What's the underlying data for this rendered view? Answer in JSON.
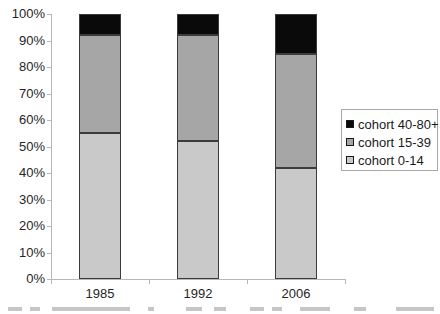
{
  "chart_data": {
    "type": "bar",
    "subtype": "stacked-100-percent-column",
    "title": "",
    "xlabel": "",
    "ylabel": "",
    "categories": [
      "1985",
      "1992",
      "2006"
    ],
    "series": [
      {
        "name": "cohort 0-14",
        "color": "#c9c9c9",
        "values": [
          55,
          52,
          42
        ]
      },
      {
        "name": "cohort 15-39",
        "color": "#a6a6a6",
        "values": [
          37,
          40,
          43
        ]
      },
      {
        "name": "cohort 40-80+",
        "color": "#0a0a0a",
        "values": [
          8,
          8,
          15
        ]
      }
    ],
    "y_tick_labels": [
      "100%",
      "90%",
      "80%",
      "70%",
      "60%",
      "50%",
      "40%",
      "30%",
      "20%",
      "10%",
      "0%"
    ],
    "ylim": [
      0,
      100
    ],
    "grid": false,
    "legend_position": "right",
    "legend_order": [
      "cohort 40-80+",
      "cohort 15-39",
      "cohort 0-14"
    ]
  },
  "colors": {
    "axis": "#b8b8b8",
    "tick_text": "#262626",
    "legend_border": "#a8a8a8",
    "segment_border": "#3c3c3c",
    "background": "#ffffff"
  }
}
